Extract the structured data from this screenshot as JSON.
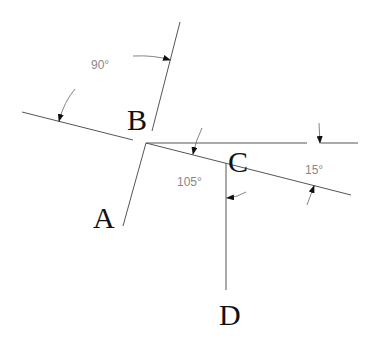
{
  "diagram": {
    "points": {
      "A": "A",
      "B": "B",
      "C": "C",
      "D": "D"
    },
    "angles": {
      "ab_angle": "90°",
      "ac_angle": "105°",
      "c_horizontal_angle": "15°"
    },
    "colors": {
      "line": "#555555",
      "label": "#111111",
      "angle_text": "#888888"
    }
  }
}
